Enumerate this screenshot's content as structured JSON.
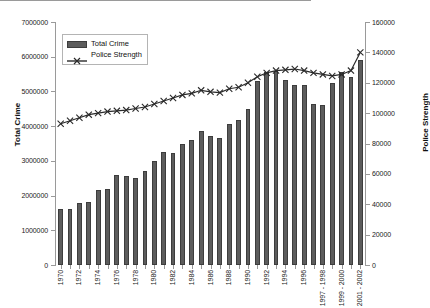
{
  "chart_data": {
    "type": "bar",
    "title": "",
    "xlabel": "",
    "ylabel": "Total Crime",
    "ylabel_right": "Police Strength",
    "ylim": [
      0,
      7000000
    ],
    "ylim_right": [
      0,
      160000
    ],
    "grid": false,
    "legend_position": "top-left-inside",
    "y_ticks": [
      "0",
      "1000000",
      "2000000",
      "3000000",
      "4000000",
      "5000000",
      "6000000",
      "7000000"
    ],
    "y_ticks_right": [
      "0",
      "20000",
      "40000",
      "60000",
      "80000",
      "100000",
      "120000",
      "140000",
      "160000"
    ],
    "categories": [
      "1970",
      "1971",
      "1972",
      "1973",
      "1974",
      "1975",
      "1976",
      "1977",
      "1978",
      "1979",
      "1980",
      "1981",
      "1982",
      "1983",
      "1984",
      "1985",
      "1986",
      "1987",
      "1988",
      "1989",
      "1990",
      "1991",
      "1992",
      "1993",
      "1994",
      "1995",
      "1996",
      "1997 - 1998",
      "1999 - 2000",
      "2001 - 2002",
      "2003",
      "2004",
      "2005"
    ],
    "tick_labels": [
      "1970",
      "",
      "1972",
      "",
      "1974",
      "",
      "1976",
      "",
      "1978",
      "",
      "1980",
      "",
      "1982",
      "",
      "1984",
      "",
      "1986",
      "",
      "1988",
      "",
      "1990",
      "",
      "1992",
      "",
      "1994",
      "",
      "1996",
      "",
      "1997 - 1998",
      "",
      "1999 - 2000",
      "",
      "2001 - 2002"
    ],
    "series": [
      {
        "name": "Total Crime",
        "axis": "left",
        "type": "bar",
        "color": "#5c5c5c",
        "values": [
          1600000,
          1620000,
          1800000,
          1820000,
          2150000,
          2180000,
          2580000,
          2550000,
          2500000,
          2720000,
          3000000,
          3250000,
          3240000,
          3480000,
          3600000,
          3850000,
          3730000,
          3670000,
          4050000,
          4180000,
          4500000,
          5300000,
          5550000,
          5600000,
          5320000,
          5200000,
          5190000,
          4650000,
          4620000,
          5230000,
          5550000,
          5420000,
          5900000
        ]
      },
      {
        "name": "Police Strength",
        "axis": "right",
        "type": "line",
        "marker": "x",
        "color": "#2a2a2a",
        "values": [
          93000,
          95000,
          97000,
          99000,
          100000,
          101000,
          101500,
          102000,
          103000,
          104000,
          106000,
          108000,
          110000,
          112000,
          113000,
          115000,
          114000,
          113500,
          116000,
          117000,
          120000,
          124000,
          126500,
          128000,
          128500,
          129000,
          128000,
          126500,
          125500,
          124500,
          125500,
          128000,
          140000
        ]
      }
    ],
    "legend": [
      {
        "label": "Total Crime",
        "marker": "bar-swatch"
      },
      {
        "label": "Police Strength",
        "marker": "line-x-marker"
      }
    ]
  }
}
